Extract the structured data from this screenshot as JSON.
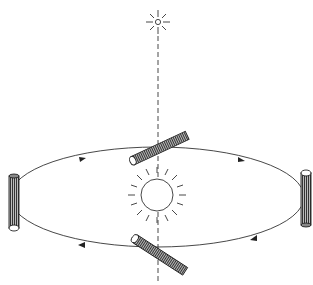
{
  "diagram": {
    "colors": {
      "stroke": "#222222",
      "background": "#ffffff"
    },
    "elements": [
      "distant-star",
      "sight-line",
      "orbit-ellipse",
      "sun",
      "rod-top",
      "rod-left",
      "rod-right",
      "rod-bottom"
    ]
  }
}
